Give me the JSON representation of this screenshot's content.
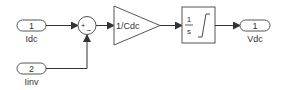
{
  "diagram": {
    "type": "simulink-block-diagram",
    "colors": {
      "line": "#333333",
      "block_stroke": "#555555",
      "background": "#ffffff"
    },
    "inports": [
      {
        "number": "1",
        "label": "Idc"
      },
      {
        "number": "2",
        "label": "Iinv"
      }
    ],
    "sum": {
      "signs": [
        "+",
        "−"
      ]
    },
    "gain": {
      "label": "1/Cdc"
    },
    "integrator": {
      "numerator": "1",
      "denominator": "s"
    },
    "outports": [
      {
        "number": "1",
        "label": "Vdc"
      }
    ]
  }
}
